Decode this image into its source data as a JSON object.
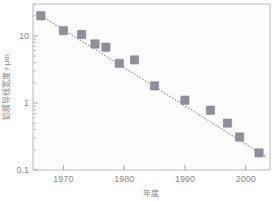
{
  "chart_data": {
    "type": "scatter",
    "title": "",
    "xlabel": "年度",
    "ylabel": "铝膜导线宽度 / μm",
    "yscale": "log",
    "xlim": [
      1965,
      2004
    ],
    "ylim": [
      0.1,
      30
    ],
    "grid": false,
    "legend": null,
    "x_ticks": [
      "1970",
      "1980",
      "1990",
      "2000"
    ],
    "x_tick_values": [
      1970,
      1980,
      1990,
      2000
    ],
    "y_ticks": [
      "10",
      "1",
      "0.1"
    ],
    "y_tick_values": [
      10,
      1,
      0.1
    ],
    "series": [
      {
        "name": "铝膜导线宽度",
        "marker": "square",
        "color": "#8f8f9c",
        "x": [
          1966.3,
          1970.0,
          1973.0,
          1975.2,
          1977.0,
          1979.2,
          1981.7,
          1985.0,
          1990.0,
          1994.2,
          1997.0,
          1999.0,
          2002.2
        ],
        "y": [
          20.0,
          12.0,
          10.5,
          7.6,
          6.8,
          3.9,
          4.4,
          1.8,
          1.1,
          0.78,
          0.5,
          0.31,
          0.18
        ]
      }
    ],
    "trend": {
      "name": "拟合趋势线",
      "style": "dotted",
      "color": "#9a9a9a",
      "x": [
        1966.0,
        2003.5
      ],
      "y": [
        21.0,
        0.155
      ]
    },
    "annotations": []
  },
  "axis": {
    "x_title": "年度",
    "y_title": "铝膜导线宽度 / μm"
  }
}
